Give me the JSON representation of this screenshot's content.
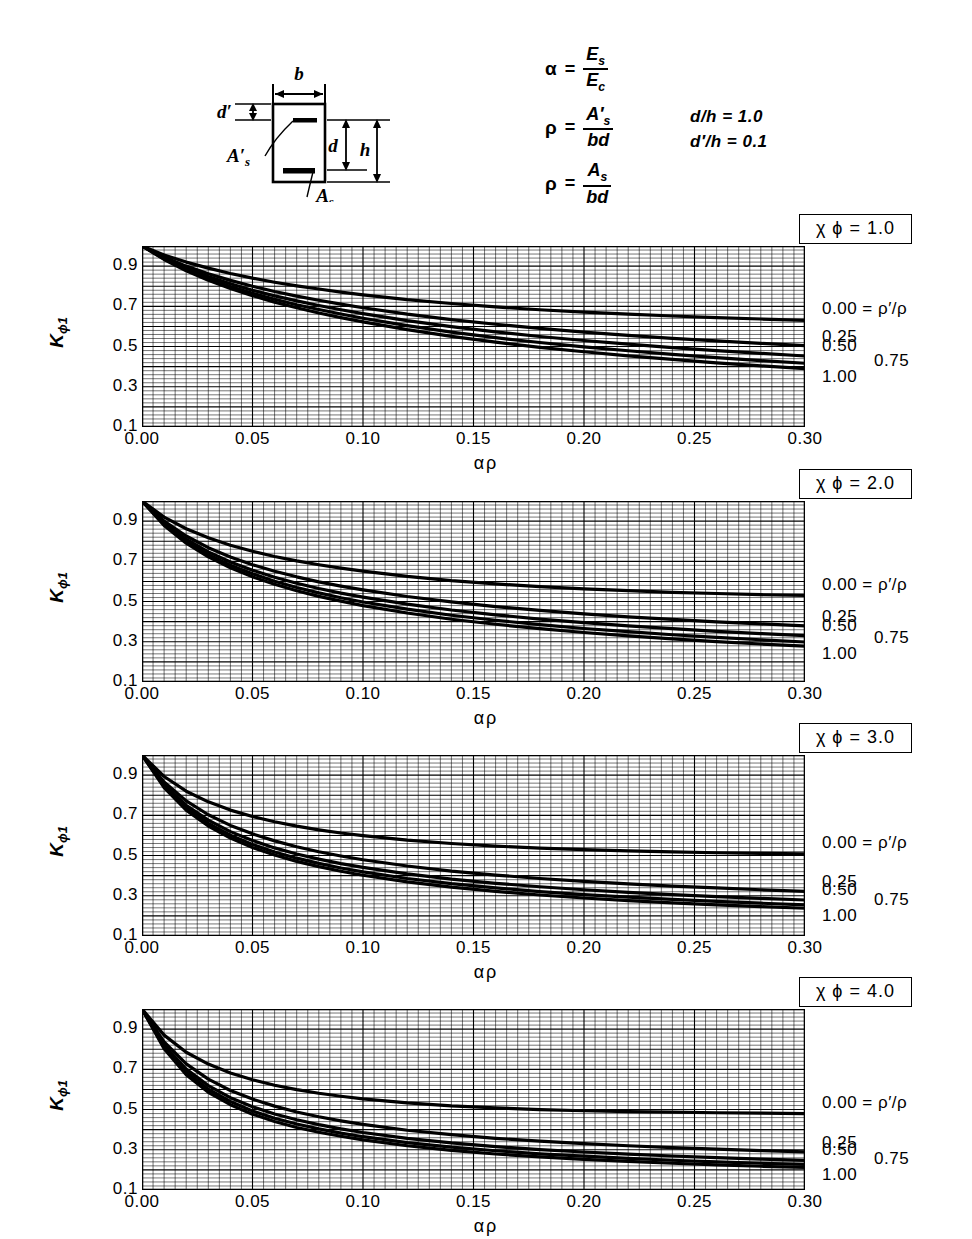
{
  "definitions": {
    "alpha": {
      "lhs": "α",
      "eq": "=",
      "num": "E",
      "num_sub": "s",
      "den": "E",
      "den_sub": "c"
    },
    "rho_prime": {
      "lhs": "ρ",
      "eq": "=",
      "num": "A′",
      "num_sub": "s",
      "den": "bd"
    },
    "rho": {
      "lhs": "ρ",
      "eq": "=",
      "num": "A",
      "num_sub": "s",
      "den": "bd"
    },
    "ratios": [
      "d/h = 1.0",
      "d′/h = 0.1"
    ]
  },
  "section_figure": {
    "labels": {
      "b": "b",
      "d_prime": "d′",
      "As_prime": "A′s",
      "d": "d",
      "h": "h",
      "As": "As"
    }
  },
  "axes": {
    "ylabel": "K",
    "ylabel_sub": "ϕ1",
    "xlabel_alpha": "α",
    "xlabel_rho": "ρ",
    "yticks": [
      "0.9",
      "0.7",
      "0.5",
      "0.3",
      "0.1"
    ],
    "ytick_values": [
      0.9,
      0.7,
      0.5,
      0.3,
      0.1
    ],
    "xticks": [
      "0.00",
      "0.05",
      "0.10",
      "0.15",
      "0.20",
      "0.25",
      "0.30"
    ],
    "xtick_values": [
      0.0,
      0.05,
      0.1,
      0.15,
      0.2,
      0.25,
      0.3
    ],
    "xlim": [
      0.0,
      0.3
    ],
    "ylim": [
      0.1,
      1.0
    ]
  },
  "curve_labels": [
    {
      "text": "0.00",
      "suffix": " = ρ′/ρ"
    },
    {
      "text": "0.25",
      "suffix": ""
    },
    {
      "text": "0.50",
      "suffix": ""
    },
    {
      "text": "0.75",
      "suffix": ""
    },
    {
      "text": "1.00",
      "suffix": ""
    }
  ],
  "panels": [
    {
      "title": "χ ϕ = 1.0",
      "chi_phi": 1.0
    },
    {
      "title": "χ ϕ = 2.0",
      "chi_phi": 2.0
    },
    {
      "title": "χ ϕ = 3.0",
      "chi_phi": 3.0
    },
    {
      "title": "χ ϕ = 4.0",
      "chi_phi": 4.0
    }
  ],
  "chart_data": {
    "type": "line",
    "xlabel": "α ρ",
    "ylabel": "K ϕ1",
    "xlim": [
      0.0,
      0.3
    ],
    "ylim": [
      0.1,
      1.0
    ],
    "grid": true,
    "legend_position": "right-of-axes",
    "series_parameter": "ρ′/ρ",
    "x": [
      0.0,
      0.01,
      0.02,
      0.03,
      0.04,
      0.05,
      0.06,
      0.07,
      0.08,
      0.09,
      0.1,
      0.12,
      0.14,
      0.16,
      0.18,
      0.2,
      0.22,
      0.24,
      0.26,
      0.28,
      0.3
    ],
    "panels": [
      {
        "name": "χ ϕ = 1.0",
        "chi_phi": 1.0,
        "series": [
          {
            "name": "0.00",
            "values": [
              1.0,
              0.955,
              0.92,
              0.89,
              0.863,
              0.84,
              0.82,
              0.802,
              0.786,
              0.771,
              0.757,
              0.733,
              0.714,
              0.697,
              0.683,
              0.671,
              0.661,
              0.652,
              0.644,
              0.637,
              0.63
            ]
          },
          {
            "name": "0.25",
            "values": [
              1.0,
              0.945,
              0.9,
              0.862,
              0.829,
              0.8,
              0.774,
              0.751,
              0.73,
              0.711,
              0.693,
              0.661,
              0.634,
              0.611,
              0.59,
              0.572,
              0.556,
              0.541,
              0.528,
              0.516,
              0.505
            ]
          },
          {
            "name": "0.50",
            "values": [
              1.0,
              0.94,
              0.89,
              0.848,
              0.812,
              0.78,
              0.752,
              0.727,
              0.704,
              0.683,
              0.664,
              0.629,
              0.599,
              0.573,
              0.55,
              0.53,
              0.512,
              0.495,
              0.48,
              0.466,
              0.453
            ]
          },
          {
            "name": "0.75",
            "values": [
              1.0,
              0.936,
              0.883,
              0.838,
              0.799,
              0.765,
              0.735,
              0.708,
              0.684,
              0.662,
              0.641,
              0.604,
              0.572,
              0.544,
              0.52,
              0.498,
              0.479,
              0.461,
              0.445,
              0.43,
              0.417
            ]
          },
          {
            "name": "1.00",
            "values": [
              1.0,
              0.933,
              0.877,
              0.83,
              0.789,
              0.753,
              0.721,
              0.693,
              0.667,
              0.644,
              0.623,
              0.584,
              0.551,
              0.522,
              0.496,
              0.474,
              0.454,
              0.436,
              0.419,
              0.404,
              0.39
            ]
          }
        ]
      },
      {
        "name": "χ ϕ = 2.0",
        "chi_phi": 2.0,
        "series": [
          {
            "name": "0.00",
            "values": [
              1.0,
              0.92,
              0.862,
              0.817,
              0.78,
              0.75,
              0.724,
              0.702,
              0.683,
              0.666,
              0.651,
              0.625,
              0.604,
              0.588,
              0.574,
              0.563,
              0.554,
              0.546,
              0.54,
              0.534,
              0.53
            ]
          },
          {
            "name": "0.25",
            "values": [
              1.0,
              0.9,
              0.826,
              0.768,
              0.722,
              0.683,
              0.651,
              0.623,
              0.598,
              0.577,
              0.558,
              0.525,
              0.498,
              0.475,
              0.456,
              0.439,
              0.424,
              0.411,
              0.399,
              0.389,
              0.379
            ]
          },
          {
            "name": "0.50",
            "values": [
              1.0,
              0.89,
              0.81,
              0.747,
              0.697,
              0.656,
              0.621,
              0.591,
              0.565,
              0.542,
              0.522,
              0.487,
              0.458,
              0.434,
              0.413,
              0.395,
              0.379,
              0.365,
              0.352,
              0.341,
              0.331
            ]
          },
          {
            "name": "0.75",
            "values": [
              1.0,
              0.884,
              0.799,
              0.733,
              0.681,
              0.638,
              0.601,
              0.57,
              0.543,
              0.519,
              0.498,
              0.462,
              0.432,
              0.407,
              0.385,
              0.366,
              0.35,
              0.335,
              0.322,
              0.31,
              0.299
            ]
          },
          {
            "name": "1.00",
            "values": [
              1.0,
              0.878,
              0.79,
              0.722,
              0.668,
              0.623,
              0.586,
              0.554,
              0.526,
              0.502,
              0.48,
              0.443,
              0.412,
              0.387,
              0.365,
              0.346,
              0.329,
              0.314,
              0.301,
              0.289,
              0.278
            ]
          }
        ]
      },
      {
        "name": "χ ϕ = 3.0",
        "chi_phi": 3.0,
        "series": [
          {
            "name": "0.00",
            "values": [
              1.0,
              0.893,
              0.82,
              0.767,
              0.726,
              0.694,
              0.668,
              0.646,
              0.628,
              0.612,
              0.599,
              0.577,
              0.56,
              0.547,
              0.537,
              0.529,
              0.523,
              0.518,
              0.514,
              0.511,
              0.508
            ]
          },
          {
            "name": "0.25",
            "values": [
              1.0,
              0.866,
              0.772,
              0.703,
              0.65,
              0.608,
              0.573,
              0.544,
              0.519,
              0.498,
              0.479,
              0.448,
              0.423,
              0.403,
              0.386,
              0.372,
              0.359,
              0.348,
              0.339,
              0.33,
              0.322
            ]
          },
          {
            "name": "0.50",
            "values": [
              1.0,
              0.853,
              0.75,
              0.676,
              0.619,
              0.575,
              0.538,
              0.508,
              0.482,
              0.46,
              0.441,
              0.409,
              0.383,
              0.362,
              0.345,
              0.33,
              0.317,
              0.306,
              0.296,
              0.287,
              0.279
            ]
          },
          {
            "name": "0.75",
            "values": [
              1.0,
              0.845,
              0.737,
              0.66,
              0.601,
              0.555,
              0.518,
              0.487,
              0.461,
              0.438,
              0.419,
              0.386,
              0.36,
              0.339,
              0.321,
              0.306,
              0.293,
              0.282,
              0.272,
              0.263,
              0.255
            ]
          },
          {
            "name": "1.00",
            "values": [
              1.0,
              0.838,
              0.726,
              0.647,
              0.587,
              0.54,
              0.503,
              0.471,
              0.445,
              0.422,
              0.402,
              0.369,
              0.343,
              0.322,
              0.304,
              0.289,
              0.276,
              0.265,
              0.255,
              0.246,
              0.238
            ]
          }
        ]
      },
      {
        "name": "χ ϕ = 4.0",
        "chi_phi": 4.0,
        "series": [
          {
            "name": "0.00",
            "values": [
              1.0,
              0.87,
              0.785,
              0.726,
              0.682,
              0.648,
              0.621,
              0.599,
              0.581,
              0.566,
              0.553,
              0.533,
              0.518,
              0.508,
              0.5,
              0.494,
              0.49,
              0.487,
              0.484,
              0.482,
              0.48
            ]
          },
          {
            "name": "0.25",
            "values": [
              1.0,
              0.836,
              0.727,
              0.651,
              0.595,
              0.552,
              0.517,
              0.488,
              0.464,
              0.444,
              0.426,
              0.397,
              0.375,
              0.357,
              0.343,
              0.331,
              0.32,
              0.311,
              0.303,
              0.296,
              0.29
            ]
          },
          {
            "name": "0.50",
            "values": [
              1.0,
              0.82,
              0.701,
              0.619,
              0.559,
              0.514,
              0.478,
              0.449,
              0.425,
              0.404,
              0.386,
              0.357,
              0.334,
              0.316,
              0.301,
              0.289,
              0.278,
              0.269,
              0.261,
              0.254,
              0.247
            ]
          },
          {
            "name": "0.75",
            "values": [
              1.0,
              0.81,
              0.686,
              0.601,
              0.54,
              0.493,
              0.457,
              0.428,
              0.404,
              0.383,
              0.365,
              0.336,
              0.313,
              0.295,
              0.28,
              0.268,
              0.257,
              0.248,
              0.24,
              0.233,
              0.227
            ]
          },
          {
            "name": "1.00",
            "values": [
              1.0,
              0.802,
              0.673,
              0.586,
              0.524,
              0.477,
              0.441,
              0.411,
              0.387,
              0.367,
              0.349,
              0.32,
              0.297,
              0.279,
              0.265,
              0.252,
              0.242,
              0.233,
              0.225,
              0.218,
              0.212
            ]
          }
        ]
      }
    ]
  }
}
